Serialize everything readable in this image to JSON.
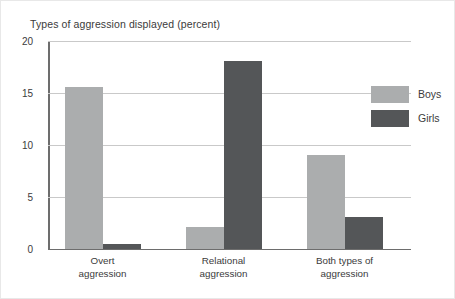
{
  "chart_data": {
    "type": "bar",
    "title": "Types of aggression displayed (percent)",
    "xlabel": "",
    "ylabel": "",
    "ylim": [
      0,
      20
    ],
    "yticks": [
      0,
      5,
      10,
      15,
      20
    ],
    "grid": true,
    "legend_position": "top-right",
    "categories": [
      "Overt aggression",
      "Relational aggression",
      "Both types of aggression"
    ],
    "category_lines": [
      [
        "Overt",
        "aggression"
      ],
      [
        "Relational",
        "aggression"
      ],
      [
        "Both types of",
        "aggression"
      ]
    ],
    "series": [
      {
        "name": "Boys",
        "color": "#abadae",
        "values": [
          15.6,
          2.1,
          9.0
        ]
      },
      {
        "name": "Girls",
        "color": "#545658",
        "values": [
          0.5,
          18.1,
          3.1
        ]
      }
    ]
  }
}
